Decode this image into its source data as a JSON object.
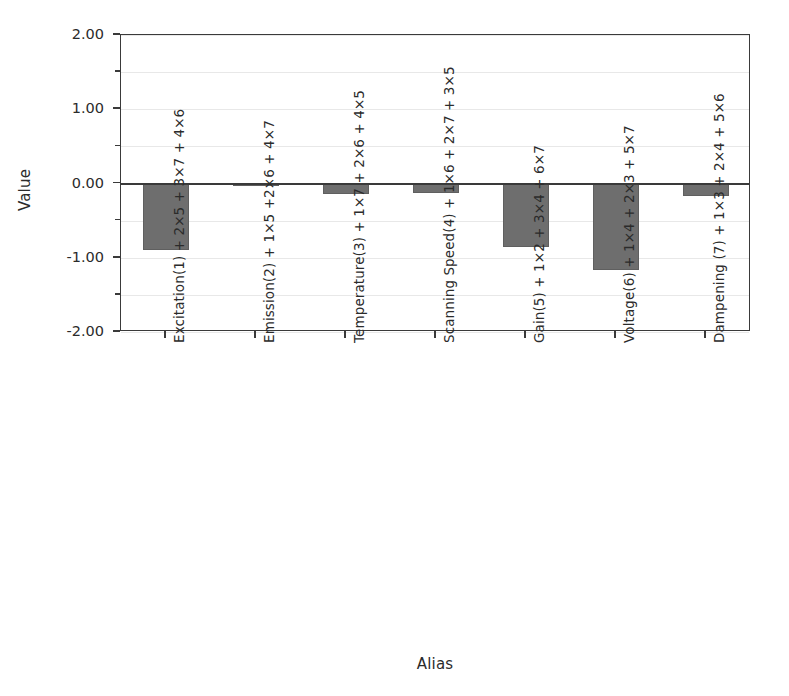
{
  "chart_data": {
    "type": "bar",
    "title": "",
    "xlabel": "Alias",
    "ylabel": "Value",
    "ylim": [
      -2.0,
      2.0
    ],
    "ytick_labels": [
      "2.00",
      "1.00",
      "0.00",
      "-1.00",
      "-2.00"
    ],
    "ytick_values": [
      2.0,
      1.0,
      0.0,
      -1.0,
      -2.0
    ],
    "yminor_tick_values": [
      1.5,
      0.5,
      -0.5,
      -1.5
    ],
    "grid": true,
    "grid_axis": "y",
    "legend": "none",
    "bar_color": "#6e6e6e",
    "axis_color": "#3a3a3a",
    "categories": [
      "Excitation(1) + 2×5 + 3×7 + 4×6",
      "Emission(2) + 1×5 +2×6 + 4×7",
      "Temperature(3) + 1×7 + 2×6 + 4×5",
      "Scanning Speed(4) + 1×6 + 2×7 + 3×5",
      "Gain(5) + 1×2 + 3×4 + 6×7",
      "Voltage(6) + 1×4 + 2×3 + 5×7",
      "Dampening (7) + 1×3 + 2×4 + 5×6"
    ],
    "values": [
      -0.9,
      -0.01,
      -0.14,
      -0.13,
      -0.85,
      -1.16,
      -0.17
    ]
  }
}
